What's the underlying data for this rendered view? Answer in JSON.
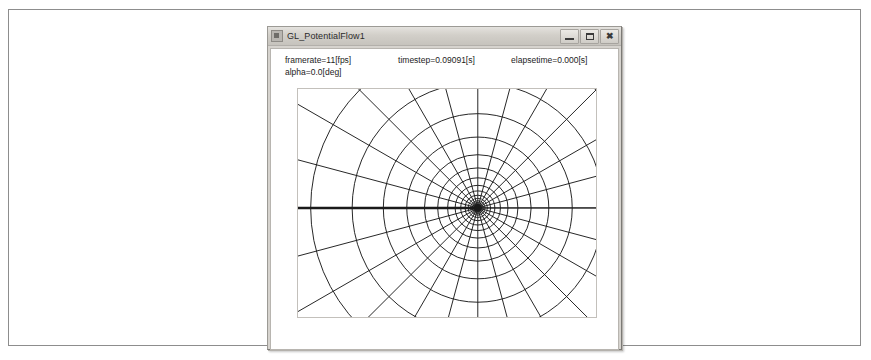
{
  "figure": {
    "border_color": "#8d8d8d",
    "background": "#ffffff"
  },
  "window": {
    "title": "GL_PotentialFlow1",
    "icon": "application-icon",
    "chrome_color": "#d6d3ce",
    "controls": [
      {
        "name": "minimize",
        "label": "–"
      },
      {
        "name": "maximize",
        "label": "□"
      },
      {
        "name": "close",
        "label": "✖"
      }
    ]
  },
  "info": {
    "framerate": "framerate=11[fps]",
    "timestep": "timestep=0.09091[s]",
    "elapsetime": "elapsetime=0.000[s]",
    "alpha": "alpha=0.0[deg]"
  },
  "chart_data": {
    "type": "line",
    "title": "",
    "xlabel": "",
    "ylabel": "",
    "grid": true,
    "legend": false,
    "center": {
      "x": 0.6033,
      "y": 0.5217
    },
    "line_color": "#1a1a1a",
    "background": "#ffffff",
    "radial_spokes": {
      "count": 24,
      "angle_step_deg": 15,
      "angles_deg": [
        0,
        15,
        30,
        45,
        60,
        75,
        90,
        105,
        120,
        135,
        150,
        165,
        180,
        195,
        210,
        225,
        240,
        255,
        270,
        285,
        300,
        315,
        330,
        345
      ]
    },
    "circles": {
      "count": 14,
      "growth_ratio": 1.33,
      "radii_px": [
        3.1,
        4.1,
        5.5,
        7.3,
        9.7,
        12.9,
        17.2,
        22.8,
        30.4,
        40.4,
        53.7,
        71.5,
        95.1,
        126.5
      ]
    },
    "branch_cut": {
      "angle_deg": 180,
      "thickness_px": 2.4,
      "from_center_to_edge": true
    },
    "axis_line": {
      "angle_deg": 0,
      "thickness_px": 1.0
    }
  }
}
